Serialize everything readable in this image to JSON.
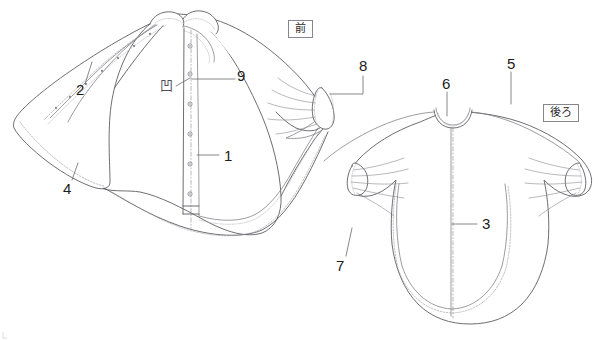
{
  "figure": {
    "background_color": "#ffffff",
    "line_color": "#5d5d63",
    "stitch_color": "#9a9aa2",
    "text_color": "#1c1c1c"
  },
  "view_tags": [
    {
      "id": "front",
      "label": "前",
      "x": 288,
      "y": 20
    },
    {
      "id": "back",
      "label": "後ろ",
      "x": 543,
      "y": 104
    }
  ],
  "callouts": [
    {
      "id": "1",
      "label": "1",
      "x": 224,
      "y": 148,
      "target": "center-front-placket"
    },
    {
      "id": "2",
      "label": "2",
      "x": 76,
      "y": 89,
      "target": "front-flap-edge-stitching"
    },
    {
      "id": "3",
      "label": "3",
      "x": 482,
      "y": 218,
      "target": "center-back-seam"
    },
    {
      "id": "4",
      "label": "4",
      "x": 63,
      "y": 186,
      "target": "front-flap-hem"
    },
    {
      "id": "5",
      "label": "5",
      "x": 509,
      "y": 63,
      "target": "back-shoulder-yoke"
    },
    {
      "id": "6",
      "label": "6",
      "x": 440,
      "y": 82,
      "target": "back-neckline"
    },
    {
      "id": "7",
      "label": "7",
      "x": 337,
      "y": 262,
      "target": "back-sleeve-hem"
    },
    {
      "id": "8",
      "label": "8",
      "x": 361,
      "y": 64,
      "target": "front-sleeve-cuff-gathers"
    },
    {
      "id": "9",
      "label": "9",
      "x": 238,
      "y": 73,
      "target": "snap-fastener-position"
    }
  ],
  "symbols": [
    {
      "id": "concave-snap",
      "glyph": "凹",
      "x": 163,
      "y": 85,
      "meaning": "concave snap component"
    }
  ],
  "details": {
    "front_snap_count": 6,
    "front_placket": "center front snap placket",
    "front_collar": "stand collar",
    "front_sleeve": "gathered cuff",
    "back_seam": "center back seam",
    "back_neckline": "round neck with binding",
    "back_sleeve": "gathered sleeve hem"
  }
}
